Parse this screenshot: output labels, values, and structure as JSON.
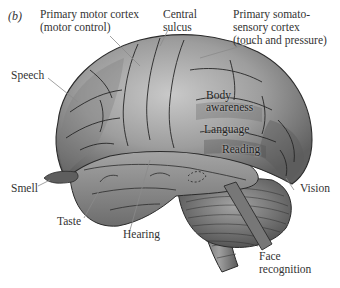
{
  "figure": {
    "panel_label": "(b)"
  },
  "labels": {
    "primary_motor_cortex": {
      "line1": "Primary motor cortex",
      "line2": "(motor control)"
    },
    "central_sulcus": {
      "line1": "Central",
      "line2": "sulcus"
    },
    "primary_somatosensory_cortex": {
      "line1": "Primary somato-",
      "line2": "sensory cortex",
      "line3": "(touch and pressure)"
    },
    "speech": "Speech",
    "body_awareness": {
      "line1": "Body",
      "line2": "awareness"
    },
    "language": "Language",
    "reading": "Reading",
    "smell": "Smell",
    "taste": "Taste",
    "hearing": "Hearing",
    "vision": "Vision",
    "face_recognition": {
      "line1": "Face",
      "line2": "recognition"
    }
  },
  "colors": {
    "cortex_light": "#b8b8b8",
    "cortex_mid": "#8f8f8f",
    "cortex_dark": "#5e5e5e",
    "sulcus_line": "#2b2b2b",
    "leader_line": "#8a8a8a",
    "label_text": "#333333"
  }
}
